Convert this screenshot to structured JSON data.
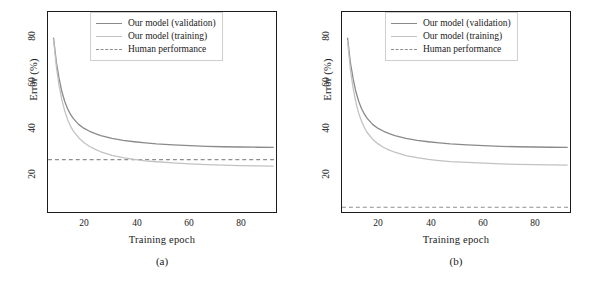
{
  "figure": {
    "panels": [
      {
        "id": "a",
        "caption": "(a)",
        "xlabel": "Training epoch",
        "ylabel": "Error (%)",
        "xticks": [
          "20",
          "40",
          "60",
          "80"
        ],
        "yticks": [
          "80",
          "60",
          "40",
          "20"
        ],
        "legend": [
          {
            "label": "Our model (validation)",
            "style": "solid",
            "color": "#8a8a8a"
          },
          {
            "label": "Our model (training)",
            "style": "solid",
            "color": "#c2c2c2"
          },
          {
            "label": "Human performance",
            "style": "dashed",
            "color": "#8f8f8f"
          }
        ]
      },
      {
        "id": "b",
        "caption": "(b)",
        "xlabel": "Training epoch",
        "ylabel": "Error (%)",
        "xticks": [
          "20",
          "40",
          "60",
          "80"
        ],
        "yticks": [
          "80",
          "60",
          "40",
          "20"
        ],
        "legend": [
          {
            "label": "Our model (validation)",
            "style": "solid",
            "color": "#8a8a8a"
          },
          {
            "label": "Our model (training)",
            "style": "solid",
            "color": "#c2c2c2"
          },
          {
            "label": "Human performance",
            "style": "dashed",
            "color": "#8f8f8f"
          }
        ]
      }
    ]
  },
  "chart_data": [
    {
      "type": "line",
      "panel": "(a)",
      "title": "",
      "xlabel": "Training epoch",
      "ylabel": "Error (%)",
      "xlim": [
        11,
        93
      ],
      "ylim": [
        8,
        92
      ],
      "xticks": [
        20,
        40,
        60,
        80
      ],
      "yticks": [
        20,
        40,
        60,
        80
      ],
      "grid": false,
      "legend_position": "top-right",
      "x": [
        13,
        14,
        15,
        16,
        17,
        18,
        19,
        20,
        22,
        24,
        26,
        28,
        30,
        34,
        38,
        42,
        46,
        50,
        56,
        62,
        68,
        74,
        80,
        86,
        92
      ],
      "series": [
        {
          "name": "Our model (validation)",
          "color": "#8a8a8a",
          "style": "solid",
          "values": [
            81.0,
            71.0,
            64.0,
            58.5,
            54.5,
            51.5,
            49.2,
            47.4,
            44.8,
            43.1,
            41.9,
            40.9,
            40.1,
            38.9,
            38.1,
            37.5,
            37.0,
            36.6,
            36.2,
            35.9,
            35.6,
            35.4,
            35.3,
            35.2,
            35.1
          ]
        },
        {
          "name": "Our model (training)",
          "color": "#c2c2c2",
          "style": "solid",
          "values": [
            80.5,
            69.0,
            61.0,
            55.0,
            50.5,
            47.0,
            44.3,
            42.2,
            39.2,
            37.1,
            35.5,
            34.3,
            33.3,
            31.8,
            30.8,
            30.1,
            29.5,
            29.1,
            28.6,
            28.2,
            27.9,
            27.7,
            27.5,
            27.4,
            27.3
          ]
        }
      ],
      "annotations": [
        {
          "type": "hline",
          "name": "Human performance",
          "value": 30.0,
          "style": "dashed",
          "color": "#8f8f8f"
        }
      ]
    },
    {
      "type": "line",
      "panel": "(b)",
      "title": "",
      "xlabel": "Training epoch",
      "ylabel": "Error (%)",
      "xlim": [
        11,
        93
      ],
      "ylim": [
        8,
        92
      ],
      "xticks": [
        20,
        40,
        60,
        80
      ],
      "yticks": [
        20,
        40,
        60,
        80
      ],
      "grid": false,
      "legend_position": "top-right",
      "x": [
        13,
        14,
        15,
        16,
        17,
        18,
        19,
        20,
        22,
        24,
        26,
        28,
        30,
        34,
        38,
        42,
        46,
        50,
        56,
        62,
        68,
        74,
        80,
        86,
        92
      ],
      "series": [
        {
          "name": "Our model (validation)",
          "color": "#8a8a8a",
          "style": "solid",
          "values": [
            81.0,
            71.0,
            64.0,
            58.5,
            54.5,
            51.5,
            49.2,
            47.4,
            44.8,
            43.1,
            41.9,
            40.9,
            40.1,
            38.9,
            38.1,
            37.5,
            37.0,
            36.6,
            36.2,
            35.9,
            35.6,
            35.4,
            35.3,
            35.2,
            35.1
          ]
        },
        {
          "name": "Our model (training)",
          "color": "#c2c2c2",
          "style": "solid",
          "values": [
            80.0,
            68.0,
            60.0,
            54.0,
            49.5,
            46.2,
            43.6,
            41.5,
            38.6,
            36.6,
            35.1,
            34.0,
            33.1,
            31.7,
            30.8,
            30.1,
            29.6,
            29.2,
            28.8,
            28.5,
            28.2,
            28.0,
            27.9,
            27.8,
            27.7
          ]
        }
      ],
      "annotations": [
        {
          "type": "hline",
          "name": "Human performance",
          "value": 10.0,
          "style": "dashed",
          "color": "#8f8f8f"
        }
      ]
    }
  ]
}
